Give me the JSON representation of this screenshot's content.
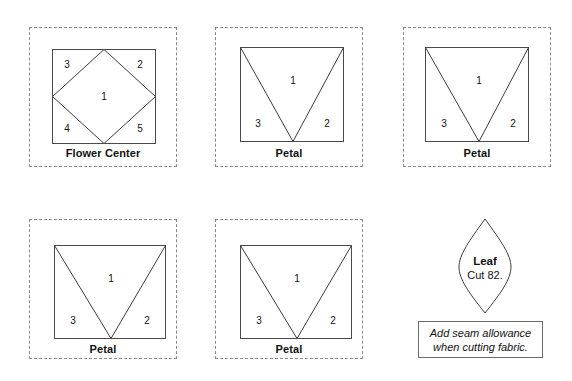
{
  "document": {
    "type": "quilt-pattern-template-sheet",
    "background_color": "#ffffff",
    "line_color": "#333333",
    "cut_line_color": "#8a8a8a",
    "text_color": "#111111"
  },
  "pieces": [
    {
      "id": "flower-center",
      "label": "Flower Center",
      "shape": "square-with-inscribed-diamond",
      "region_numbers": [
        "1",
        "2",
        "3",
        "4",
        "5"
      ],
      "box": {
        "x": 29,
        "y": 27,
        "w": 148,
        "h": 140
      },
      "square": {
        "x": 23,
        "y": 22,
        "w": 103,
        "h": 94
      },
      "label_y": 120
    },
    {
      "id": "petal-1",
      "label": "Petal",
      "shape": "square-with-v-split",
      "region_numbers": [
        "1",
        "2",
        "3"
      ],
      "box": {
        "x": 215,
        "y": 27,
        "w": 148,
        "h": 140
      },
      "square": {
        "x": 25,
        "y": 20,
        "w": 103,
        "h": 94
      },
      "label_y": 120
    },
    {
      "id": "petal-2",
      "label": "Petal",
      "shape": "square-with-v-split",
      "region_numbers": [
        "1",
        "2",
        "3"
      ],
      "box": {
        "x": 403,
        "y": 27,
        "w": 148,
        "h": 140
      },
      "square": {
        "x": 22,
        "y": 20,
        "w": 103,
        "h": 94
      },
      "label_y": 120
    },
    {
      "id": "petal-3",
      "label": "Petal",
      "shape": "square-with-v-split",
      "region_numbers": [
        "1",
        "2",
        "3"
      ],
      "box": {
        "x": 29,
        "y": 219,
        "w": 148,
        "h": 140
      },
      "square": {
        "x": 25,
        "y": 26,
        "w": 111,
        "h": 93
      },
      "label_y": 124
    },
    {
      "id": "petal-4",
      "label": "Petal",
      "shape": "square-with-v-split",
      "region_numbers": [
        "1",
        "2",
        "3"
      ],
      "box": {
        "x": 215,
        "y": 219,
        "w": 148,
        "h": 140
      },
      "square": {
        "x": 25,
        "y": 26,
        "w": 111,
        "h": 93
      },
      "label_y": 124
    }
  ],
  "leaf": {
    "id": "leaf",
    "title": "Leaf",
    "count_text": "Cut 82.",
    "shape": "pointed-oval-leaf",
    "box": {
      "x": 449,
      "y": 217,
      "w": 72,
      "h": 98
    }
  },
  "note": {
    "id": "seam-allowance-note",
    "line1": "Add seam allowance",
    "line2": "when cutting fabric.",
    "box": {
      "x": 418,
      "y": 321,
      "w": 125,
      "h": 37
    }
  }
}
